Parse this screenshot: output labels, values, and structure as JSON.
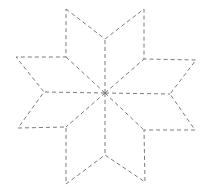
{
  "figure": {
    "width": 208,
    "height": 194,
    "background": "#ffffff",
    "stroke_color": "#7a7a7a",
    "center": [
      105,
      93
    ],
    "outline_points": [
      [
        66,
        9
      ],
      [
        105,
        39
      ],
      [
        144,
        9
      ],
      [
        144,
        59
      ],
      [
        196,
        60
      ],
      [
        170,
        94
      ],
      [
        195,
        130
      ],
      [
        144,
        130
      ],
      [
        145,
        182
      ],
      [
        105,
        155
      ],
      [
        66,
        184
      ],
      [
        66,
        127
      ],
      [
        18,
        128
      ],
      [
        44,
        92
      ],
      [
        16,
        57
      ],
      [
        66,
        57
      ]
    ],
    "spokes": [
      [
        105,
        39
      ],
      [
        144,
        59
      ],
      [
        170,
        94
      ],
      [
        144,
        130
      ],
      [
        105,
        155
      ],
      [
        66,
        127
      ],
      [
        44,
        92
      ],
      [
        66,
        57
      ]
    ]
  }
}
